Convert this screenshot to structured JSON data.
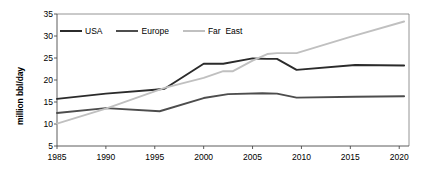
{
  "chart_data": {
    "type": "line",
    "title": "",
    "xlabel": "",
    "ylabel": "million bbl/day",
    "xlim": [
      1985,
      2021
    ],
    "ylim": [
      5,
      35
    ],
    "xticks": [
      1985,
      1990,
      1995,
      2000,
      2005,
      2010,
      2015,
      2020
    ],
    "yticks": [
      5,
      10,
      15,
      20,
      25,
      30,
      35
    ],
    "grid": false,
    "legend_position": "top-left inside",
    "series": [
      {
        "name": "USA",
        "color": "#2b2b2b",
        "x": [
          1985,
          1990,
          1995,
          1996,
          2000,
          2002,
          2005,
          2006.5,
          2007.5,
          2009.5,
          2015.5,
          2020.5
        ],
        "values": [
          15.7,
          16.9,
          17.8,
          18.0,
          23.7,
          23.7,
          24.9,
          24.8,
          24.8,
          22.3,
          23.4,
          23.3
        ]
      },
      {
        "name": "Europe",
        "color": "#4d4d4d",
        "x": [
          1985,
          1990,
          1995.5,
          2000,
          2002.5,
          2006,
          2007.5,
          2009.5,
          2015.5,
          2020.5
        ],
        "values": [
          12.5,
          13.6,
          12.9,
          15.9,
          16.8,
          17.0,
          16.9,
          16.0,
          16.2,
          16.3
        ]
      },
      {
        "name": "Far  East",
        "color": "#c0c0c0",
        "x": [
          1985,
          1990,
          1996,
          2000,
          2002,
          2003,
          2005,
          2006.5,
          2007.5,
          2009.5,
          2015,
          2020.5
        ],
        "values": [
          10.1,
          13.5,
          18.2,
          20.5,
          22.0,
          22.0,
          24.4,
          25.9,
          26.1,
          26.1,
          29.8,
          33.3
        ]
      }
    ]
  },
  "legend": {
    "items": [
      {
        "label": "USA",
        "color": "#2b2b2b"
      },
      {
        "label": "Europe",
        "color": "#4d4d4d"
      },
      {
        "label": "Far  East",
        "color": "#c0c0c0"
      }
    ]
  },
  "axes": {
    "y_title": "million bbl/day",
    "y_tick_labels": [
      "35",
      "30",
      "25",
      "20",
      "15",
      "10",
      "5"
    ],
    "x_tick_labels": [
      "1985",
      "1990",
      "1995",
      "2000",
      "2005",
      "2010",
      "2015",
      "2020"
    ]
  }
}
